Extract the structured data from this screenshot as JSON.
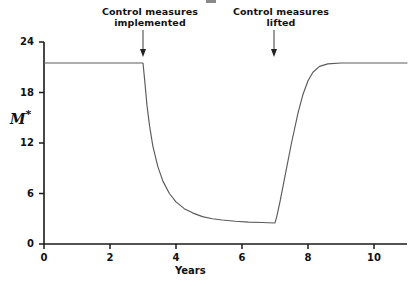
{
  "chart_data": {
    "type": "line",
    "title": "",
    "xlabel": "Years",
    "ylabel": "M*",
    "xlim": [
      0,
      11
    ],
    "ylim": [
      0,
      24
    ],
    "xticks": [
      0,
      2,
      4,
      6,
      8,
      10
    ],
    "yticks": [
      0,
      6,
      12,
      18,
      24
    ],
    "grid": false,
    "legend": null,
    "series": [
      {
        "name": "M*",
        "x": [
          0,
          0.5,
          1,
          1.5,
          2,
          2.5,
          3,
          3.05,
          3.12,
          3.2,
          3.3,
          3.45,
          3.6,
          3.8,
          4,
          4.25,
          4.5,
          4.8,
          5.1,
          5.4,
          5.8,
          6.2,
          6.6,
          7,
          7.05,
          7.15,
          7.3,
          7.5,
          7.7,
          7.85,
          8,
          8.15,
          8.35,
          8.6,
          9,
          9.5,
          10,
          10.5,
          11
        ],
        "y": [
          21.5,
          21.5,
          21.5,
          21.5,
          21.5,
          21.5,
          21.5,
          19.5,
          16.5,
          14.0,
          11.6,
          9.2,
          7.5,
          6.0,
          5.0,
          4.2,
          3.7,
          3.25,
          3.0,
          2.85,
          2.7,
          2.6,
          2.55,
          2.5,
          3.2,
          5.0,
          8.0,
          12.0,
          15.6,
          17.8,
          19.4,
          20.4,
          21.1,
          21.4,
          21.5,
          21.5,
          21.5,
          21.5,
          21.5
        ]
      }
    ],
    "annotations": [
      {
        "name": "control-measures-implemented",
        "text": "Control measures\nimplemented",
        "x": 3,
        "arrow": "down"
      },
      {
        "name": "control-measures-lifted",
        "text": "Control measures\nlifted",
        "x": 7,
        "arrow": "down"
      }
    ],
    "upper_plateau": 21.5,
    "lower_plateau": 2.5,
    "intervention_start_year": 3,
    "intervention_end_year": 7
  },
  "axes": {
    "y_tick_labels": [
      "0",
      "6",
      "12",
      "18",
      "24"
    ],
    "x_tick_labels": [
      "0",
      "2",
      "4",
      "6",
      "8",
      "10"
    ],
    "x_axis_title": "Years",
    "y_axis_title_main": "M",
    "y_axis_title_sup": "*"
  },
  "annotation_labels": {
    "first_line1": "Control measures",
    "first_line2": "implemented",
    "second_line1": "Control measures",
    "second_line2": "lifted"
  },
  "colors": {
    "axis": "#1a1a1a",
    "curve": "#5a5a5a",
    "text": "#111111",
    "background": "#ffffff"
  }
}
